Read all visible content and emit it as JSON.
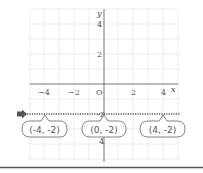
{
  "diagram": {
    "type": "coordinate-plane",
    "axes": {
      "x_label": "x",
      "y_label": "y",
      "origin_label": "O",
      "x_ticks": [
        "−4",
        "−2",
        "2",
        "4"
      ],
      "y_ticks": [
        "4",
        "2",
        "−2",
        "−4"
      ]
    },
    "line": {
      "description": "horizontal dotted line y = -2",
      "y_value": -2,
      "style": "dotted",
      "arrow": "right-pointing arrow at left end"
    },
    "points": [
      {
        "label": "(-4, -2)",
        "x": -4,
        "y": -2
      },
      {
        "label": "(0, -2)",
        "x": 0,
        "y": -2
      },
      {
        "label": "(4, -2)",
        "x": 4,
        "y": -2
      }
    ],
    "colors": {
      "grid": "#e6e6e6",
      "axis": "#666666",
      "dotted_line": "#555555",
      "arrow": "#555555",
      "bottom_rule": "#555555"
    }
  }
}
